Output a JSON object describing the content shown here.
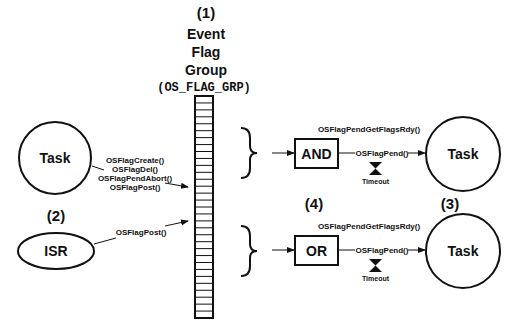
{
  "diagram": {
    "group": {
      "number": "(1)",
      "title_lines": [
        "Event",
        "Flag",
        "Group"
      ],
      "type_name": "(OS_FLAG_GRP)",
      "cell_count": 32
    },
    "sources": {
      "number": "(2)",
      "task": {
        "label": "Task",
        "calls": [
          "OSFlagCreate()",
          "OSFlagDel()",
          "OSFlagPendAbort()",
          "OSFlagPost()"
        ]
      },
      "isr": {
        "label": "ISR",
        "calls": [
          "OSFlagPost()"
        ]
      }
    },
    "logic": {
      "number": "(4)",
      "and_gate": {
        "label": "AND"
      },
      "or_gate": {
        "label": "OR"
      }
    },
    "waiters": {
      "number": "(3)",
      "rows": [
        {
          "gate": "AND",
          "get_flags_call": "OSFlagPendGetFlagsRdy()",
          "pend_call": "OSFlagPend()",
          "timeout_label": "Timeout",
          "task_label": "Task"
        },
        {
          "gate": "OR",
          "get_flags_call": "OSFlagPendGetFlagsRdy()",
          "pend_call": "OSFlagPend()",
          "timeout_label": "Timeout",
          "task_label": "Task"
        }
      ]
    },
    "colors": {
      "line": "#111111",
      "background": "#ffffff"
    }
  }
}
